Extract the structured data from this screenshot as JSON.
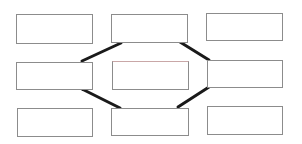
{
  "diagram": {
    "type": "grid-of-boxes-with-connectors",
    "colors": {
      "background": "#ffffff",
      "box_border": "#8c8c8c",
      "connector": "#1a1a1a",
      "top_tint": "#c9a7a7"
    },
    "nodes": [
      {
        "id": "top-left",
        "label": "",
        "x": 16,
        "y": 14,
        "w": 77,
        "h": 30
      },
      {
        "id": "top-center",
        "label": "",
        "x": 111,
        "y": 14,
        "w": 77,
        "h": 29
      },
      {
        "id": "top-right",
        "label": "",
        "x": 206,
        "y": 13,
        "w": 77,
        "h": 28
      },
      {
        "id": "middle-left",
        "label": "",
        "x": 16,
        "y": 62,
        "w": 77,
        "h": 28
      },
      {
        "id": "middle-center",
        "label": "",
        "x": 112,
        "y": 61,
        "w": 77,
        "h": 29
      },
      {
        "id": "middle-right",
        "label": "",
        "x": 207,
        "y": 60,
        "w": 76,
        "h": 28
      },
      {
        "id": "bottom-left",
        "label": "",
        "x": 17,
        "y": 108,
        "w": 76,
        "h": 29
      },
      {
        "id": "bottom-center",
        "label": "",
        "x": 111,
        "y": 108,
        "w": 78,
        "h": 28
      },
      {
        "id": "bottom-right",
        "label": "",
        "x": 207,
        "y": 106,
        "w": 76,
        "h": 29
      }
    ],
    "edges": [
      {
        "from": "top-center",
        "to": "middle-left",
        "x1": 121,
        "y1": 43,
        "x2": 82,
        "y2": 61
      },
      {
        "from": "top-center",
        "to": "middle-right",
        "x1": 180,
        "y1": 42,
        "x2": 209,
        "y2": 60
      },
      {
        "from": "middle-left",
        "to": "bottom-center",
        "x1": 82,
        "y1": 89,
        "x2": 120,
        "y2": 108
      },
      {
        "from": "middle-right",
        "to": "bottom-center",
        "x1": 209,
        "y1": 87,
        "x2": 178,
        "y2": 107
      }
    ]
  }
}
